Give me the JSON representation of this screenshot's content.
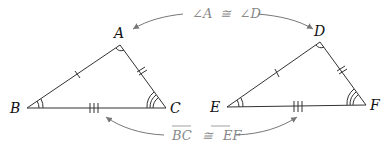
{
  "triangle1": {
    "vertices": {
      "A": "A",
      "B": "B",
      "C": "C"
    }
  },
  "triangle2": {
    "vertices": {
      "D": "D",
      "E": "E",
      "F": "F"
    }
  },
  "annotations": {
    "angle_congruence": {
      "left": "∠A",
      "symbol": "≅",
      "right": "∠D"
    },
    "side_congruence": {
      "left": "BC",
      "symbol": "≅",
      "right": "EF"
    }
  },
  "colors": {
    "line": "#333333",
    "annotation": "#888888",
    "arrow": "#777777"
  }
}
